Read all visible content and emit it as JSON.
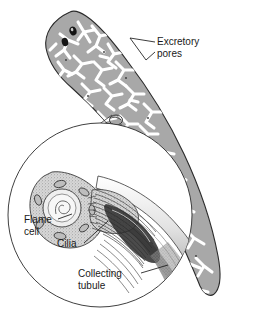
{
  "figure": {
    "background_color": "#ffffff",
    "organism": "planarian flatworm",
    "body_color": "#a8a8a8",
    "tubule_color": "#ffffff",
    "outline_color": "#1a1a1a",
    "text_color": "#1a1a1a"
  },
  "labels": {
    "excretory_pores_line1": "Excretory",
    "excretory_pores_line2": "pores",
    "flame_cell_line1": "Flame",
    "flame_cell_line2": "cell",
    "cilia": "Cilia",
    "collecting_tubule_line1": "Collecting",
    "collecting_tubule_line2": "tubule"
  },
  "parts": {
    "worm_body": "worm-body",
    "eyespot_left": "eyespot",
    "eyespot_right": "eyespot",
    "tubule_network": "branching-excretory-tubule-network",
    "inset_circle": "magnification-inset",
    "flame_cell_nucleus": "nucleus",
    "cilia_bundle": "cilia-bundle",
    "collecting_tubule": "collecting-tubule"
  }
}
